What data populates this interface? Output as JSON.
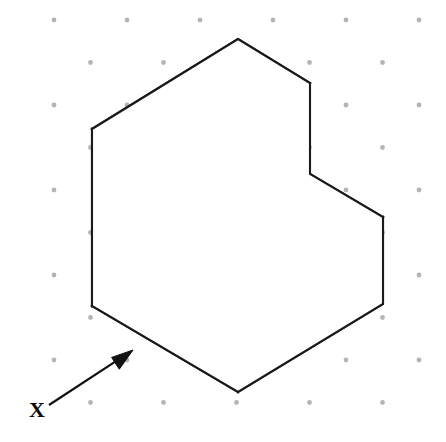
{
  "figure": {
    "background_color": "#ffffff",
    "line_color": "#1a1a1a",
    "dot_grid": {
      "color": "#b4b4b4",
      "radius": 2.4,
      "column_spacing": 73,
      "row_spacing": 42.5,
      "origin_x": 54,
      "origin_y": 20,
      "columns": 7,
      "rows": 11,
      "description": "isometric dot paper"
    },
    "solid": {
      "name": "two-step L-shaped block",
      "stroke_width": 2.1,
      "fill": "#ffffff",
      "vertices": {
        "top_apex": [
          238,
          39
        ],
        "top_left": [
          92,
          129
        ],
        "top_right_back": [
          310,
          83
        ],
        "upper_front_left": [
          165,
          171
        ],
        "step_back_right": [
          310,
          174
        ],
        "step_inner_corner": [
          166,
          260
        ],
        "far_right": [
          383,
          217
        ],
        "front_middle": [
          238,
          305
        ],
        "front_bottom": [
          238,
          392
        ],
        "left_bottom": [
          92,
          306
        ],
        "right_bottom": [
          383,
          304
        ]
      },
      "faces": [
        {
          "name": "upper-top-face",
          "points": "92,129 238,39 310,83 165,171"
        },
        {
          "name": "upper-left-face",
          "points": "92,129 165,171 166,260 92,306"
        },
        {
          "name": "step-tread-face",
          "points": "166,260 310,174 383,217 238,305"
        },
        {
          "name": "step-riser-face",
          "points": "165,171 310,174 310,83"
        },
        {
          "name": "lower-front-left-face",
          "points": "92,306 166,260 238,305 238,392"
        },
        {
          "name": "lower-front-right-face",
          "points": "238,305 383,217 383,304 238,392"
        }
      ],
      "outline": "92,129 238,39 310,83 310,174 383,217 383,304 238,392 92,306",
      "internal_edges": [
        {
          "name": "edge-top-apex-to-front",
          "from": [
            165,
            171
          ],
          "to": [
            92,
            129
          ]
        },
        {
          "name": "edge-top-right-to-front",
          "from": [
            165,
            171
          ],
          "to": [
            310,
            83
          ]
        },
        {
          "name": "edge-riser-vertical",
          "from": [
            165,
            171
          ],
          "to": [
            166,
            260
          ]
        },
        {
          "name": "edge-step-tread-back",
          "from": [
            166,
            260
          ],
          "to": [
            310,
            174
          ]
        },
        {
          "name": "edge-step-tread-front",
          "from": [
            166,
            260
          ],
          "to": [
            238,
            305
          ]
        },
        {
          "name": "edge-tread-to-far-right",
          "from": [
            238,
            305
          ],
          "to": [
            383,
            217
          ]
        },
        {
          "name": "edge-front-vertical",
          "from": [
            238,
            305
          ],
          "to": [
            238,
            392
          ]
        }
      ]
    },
    "annotation": {
      "label": "X",
      "label_x": 29,
      "label_y": 417,
      "leader_from": [
        49,
        405
      ],
      "leader_to": [
        133,
        350
      ],
      "arrow_tip": [
        133,
        349
      ],
      "arrow_color": "#111111",
      "meaning": "direction of sight X"
    }
  }
}
